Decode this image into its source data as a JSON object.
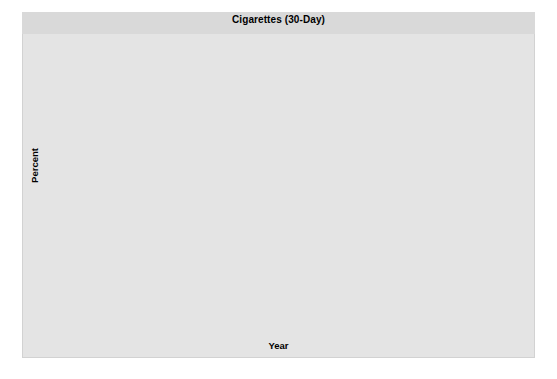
{
  "chart_data": {
    "type": "line",
    "title": "Cigarettes (30-Day)",
    "xlabel": "Year",
    "ylabel": "Percent",
    "ylim": [
      0,
      60
    ],
    "ytick_step": 10,
    "yticks": [
      "0",
      "10",
      "20",
      "30",
      "40",
      "50",
      "60"
    ],
    "xlim": [
      1975,
      2016
    ],
    "xtick_step": 2,
    "xticks": [
      "'76",
      "'78",
      "'80",
      "'82",
      "'84",
      "'86",
      "'88",
      "'90",
      "'92",
      "'94",
      "'96",
      "'98",
      "'00",
      "'02",
      "'04",
      "'06",
      "'08",
      "'10",
      "'12",
      "'14",
      "'16"
    ],
    "grid": false,
    "legend_position": "top-left",
    "series": [
      {
        "name": "8th Grade",
        "name_prefix": "8",
        "name_sup": "th",
        "name_suffix": " Grade",
        "color": "#b3b3b3",
        "marker": "diamond",
        "x": [
          1975,
          1976,
          1977,
          1978,
          1979,
          1980,
          1981,
          1982,
          1983,
          1984,
          1985,
          1986,
          1987,
          1988,
          1989,
          1990,
          1991,
          1992,
          1993,
          1994,
          1995,
          1996,
          1997,
          1998,
          1999,
          2000,
          2001,
          2002,
          2003,
          2004,
          2005,
          2006,
          2007,
          2008,
          2009,
          2010,
          2011,
          2012,
          2013,
          2014,
          2015,
          2016
        ],
        "values": [
          36.7,
          38.8,
          38.4,
          36.7,
          34.4,
          30.5,
          29.4,
          30.0,
          30.3,
          29.3,
          30.1,
          29.6,
          29.4,
          28.7,
          28.6,
          29.4,
          28.3,
          27.8,
          29.9,
          31.2,
          33.5,
          34.0,
          36.5,
          35.1,
          34.6,
          31.4,
          29.5,
          26.7,
          24.4,
          25.0,
          23.2,
          21.6,
          21.6,
          20.4,
          20.1,
          19.2,
          18.7,
          17.1,
          16.3,
          13.6,
          11.4,
          10.5
        ]
      },
      {
        "name": "10th Grade",
        "name_prefix": "10",
        "name_sup": "th",
        "name_suffix": " Grade",
        "color": "#646464",
        "marker": "square",
        "x": [
          1991,
          1992,
          1993,
          1994,
          1995,
          1996,
          1997,
          1998,
          1999,
          2000,
          2001,
          2002,
          2003,
          2004,
          2005,
          2006,
          2007,
          2008,
          2009,
          2010,
          2011,
          2012,
          2013,
          2014,
          2015,
          2016
        ],
        "values": [
          21.5,
          21.5,
          24.7,
          25.4,
          27.9,
          30.4,
          29.8,
          27.6,
          25.7,
          23.9,
          21.3,
          17.7,
          16.7,
          16.0,
          14.9,
          14.5,
          14.0,
          12.3,
          13.1,
          12.8,
          11.8,
          10.8,
          9.1,
          7.2,
          6.3,
          5.0
        ]
      },
      {
        "name": "12th Grade",
        "name_prefix": "12",
        "name_sup": "th",
        "name_suffix": " Grade",
        "color": "#2b2b2b",
        "marker": "triangle",
        "x": [
          1991,
          1992,
          1993,
          1994,
          1995,
          1996,
          1997,
          1998,
          1999,
          2000,
          2001,
          2002,
          2003,
          2004,
          2005,
          2006,
          2007,
          2008,
          2009,
          2010,
          2011,
          2012,
          2013,
          2014,
          2015,
          2016
        ],
        "values": [
          15.1,
          16.3,
          17.8,
          18.7,
          19.4,
          21.5,
          20.8,
          19.8,
          18.8,
          17.0,
          15.0,
          13.4,
          12.2,
          12.0,
          11.3,
          10.5,
          10.9,
          10.1,
          11.2,
          10.7,
          10.3,
          9.3,
          8.5,
          6.7,
          5.5,
          4.5
        ]
      }
    ]
  }
}
